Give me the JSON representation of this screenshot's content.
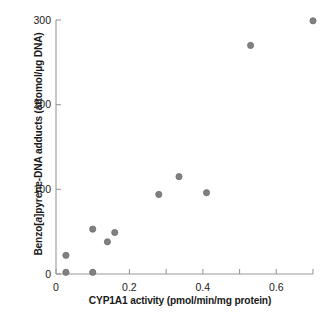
{
  "chart_data": {
    "type": "scatter",
    "title": "",
    "xlabel": "CYP1A1 activity (pmol/min/mg protein)",
    "ylabel_parts": {
      "pre": "Benzo[",
      "italic": "a",
      "post": "]pyrene-DNA adducts (attomol/µg DNA)"
    },
    "ylabel": "Benzo[a]pyrene-DNA adducts (attomol/µg DNA)",
    "xlim": [
      0,
      0.7
    ],
    "ylim": [
      0,
      300
    ],
    "grid": false,
    "legend": "none",
    "marker": {
      "shape": "circle",
      "color": "#808080",
      "edge_color": "#6e6e6e",
      "size_px": 6.2
    },
    "axis_color": "#9a9a9a",
    "x_ticks": [
      0,
      0.1,
      0.2,
      0.3,
      0.4,
      0.5,
      0.6,
      0.7
    ],
    "x_tick_labels": [
      "0",
      "",
      "0.2",
      "",
      "0.4",
      "",
      "0.6",
      ""
    ],
    "y_ticks": [
      0,
      100,
      200,
      300
    ],
    "y_tick_labels": [
      "0",
      "100",
      "200",
      "300"
    ],
    "x": [
      0.027,
      0.027,
      0.1,
      0.1,
      0.14,
      0.16,
      0.28,
      0.335,
      0.41,
      0.53,
      0.7
    ],
    "y": [
      22,
      2,
      2,
      53,
      38,
      49,
      94,
      115,
      96,
      270,
      299
    ],
    "points": [
      {
        "x": 0.027,
        "y": 22
      },
      {
        "x": 0.027,
        "y": 2
      },
      {
        "x": 0.1,
        "y": 2
      },
      {
        "x": 0.1,
        "y": 53
      },
      {
        "x": 0.14,
        "y": 38
      },
      {
        "x": 0.16,
        "y": 49
      },
      {
        "x": 0.28,
        "y": 94
      },
      {
        "x": 0.335,
        "y": 115
      },
      {
        "x": 0.41,
        "y": 96
      },
      {
        "x": 0.53,
        "y": 270
      },
      {
        "x": 0.7,
        "y": 299
      }
    ]
  },
  "layout": {
    "plot_left_px": 56,
    "plot_right_px": 313,
    "plot_top_px": 20,
    "plot_bottom_px": 274
  }
}
